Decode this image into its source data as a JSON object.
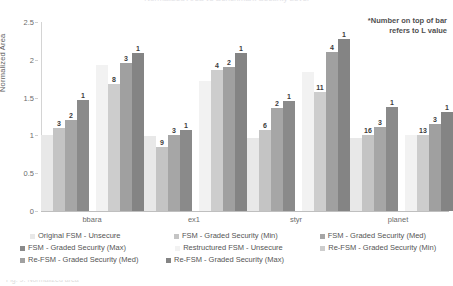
{
  "title_sliver": "Normalized Area vs Benchmark Security Level",
  "caption_sliver": "Fig. 9. Normalized area",
  "annotation": {
    "line1": "*Number on top of bar",
    "line2": "refers to L value"
  },
  "axes": {
    "ylabel": "Normalized Area",
    "yticks": [
      "0",
      "0.5",
      "1",
      "1.5",
      "2",
      "2.5"
    ],
    "ymin": 0,
    "ymax": 2.5,
    "categories": [
      "bbara",
      "ex1",
      "styr",
      "planet"
    ]
  },
  "legend": {
    "items": [
      {
        "label": "Original FSM - Unsecure",
        "color": "#e8e8e8"
      },
      {
        "label": "FSM - Graded Security (Min)",
        "color": "#c4c4c4"
      },
      {
        "label": "FSM - Graded Security (Med)",
        "color": "#a6a6a6"
      },
      {
        "label": "FSM - Graded Security (Max)",
        "color": "#8a8a8a"
      },
      {
        "label": "Restructured FSM - Unsecure",
        "color": "#f2f2f2"
      },
      {
        "label": "Re-FSM - Graded Security (Min)",
        "color": "#cdcdcd"
      },
      {
        "label": "Re-FSM - Graded Security (Med)",
        "color": "#a0a0a0"
      },
      {
        "label": "Re-FSM - Graded Security (Max)",
        "color": "#848484"
      }
    ]
  },
  "chart_data": {
    "type": "bar",
    "title": "",
    "xlabel": "",
    "ylabel": "Normalized Area",
    "ylim": [
      0,
      2.5
    ],
    "yticks": [
      0,
      0.5,
      1,
      1.5,
      2,
      2.5
    ],
    "grid": false,
    "legend_position": "bottom",
    "categories": [
      "bbara",
      "ex1",
      "styr",
      "planet"
    ],
    "series": [
      {
        "name": "Original FSM - Unsecure",
        "color": "#e8e8e8",
        "values": [
          1.0,
          0.99,
          0.97,
          0.96
        ],
        "labels": [
          "",
          "",
          "",
          ""
        ]
      },
      {
        "name": "FSM - Graded Security (Min)",
        "color": "#c4c4c4",
        "values": [
          1.1,
          0.85,
          1.07,
          1.01
        ],
        "labels": [
          "3",
          "9",
          "6",
          "16"
        ]
      },
      {
        "name": "FSM - Graded Security (Med)",
        "color": "#a6a6a6",
        "values": [
          1.21,
          1.01,
          1.36,
          1.11
        ],
        "labels": [
          "2",
          "3",
          "2",
          "3"
        ]
      },
      {
        "name": "FSM - Graded Security (Max)",
        "color": "#8a8a8a",
        "values": [
          1.47,
          1.07,
          1.45,
          1.37
        ],
        "labels": [
          "1",
          "1",
          "1",
          "1"
        ]
      },
      {
        "name": "Restructured FSM - Unsecure",
        "color": "#f2f2f2",
        "values": [
          1.93,
          1.72,
          1.84,
          1.01
        ],
        "labels": [
          "",
          "",
          "",
          ""
        ]
      },
      {
        "name": "Re-FSM - Graded Security (Min)",
        "color": "#cdcdcd",
        "values": [
          1.68,
          1.87,
          1.57,
          1.01
        ],
        "labels": [
          "8",
          "4",
          "11",
          "13"
        ]
      },
      {
        "name": "Re-FSM - Graded Security (Med)",
        "color": "#a0a0a0",
        "values": [
          1.96,
          1.91,
          2.1,
          1.15
        ],
        "labels": [
          "3",
          "2",
          "4",
          "3"
        ]
      },
      {
        "name": "Re-FSM - Graded Security (Max)",
        "color": "#848484",
        "values": [
          2.09,
          2.09,
          2.27,
          1.31
        ],
        "labels": [
          "1",
          "1",
          "1",
          "1"
        ]
      }
    ],
    "annotation": "*Number on top of bar refers to L value"
  }
}
